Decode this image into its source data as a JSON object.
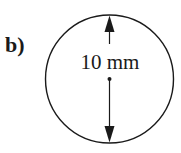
{
  "figure": {
    "part_label": "b)",
    "dimension_text": "10 mm",
    "shape": "circle",
    "dimension": "diameter",
    "colors": {
      "stroke": "#1a1a1a",
      "background": "#ffffff"
    }
  }
}
